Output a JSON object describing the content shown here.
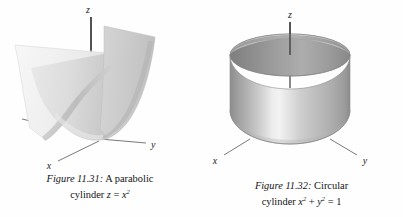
{
  "page": {
    "background": "#ffffff",
    "ink": "#1a1a1a"
  },
  "figures": [
    {
      "id": "figure-11-31",
      "label": "Figure 11.31:",
      "caption_line1": "A parabolic",
      "caption_line2_prefix": "cylinder ",
      "caption_line2_var1": "z",
      "caption_line2_eq": " = ",
      "caption_line2_var2": "x",
      "caption_line2_exp2": "2",
      "caption_plain": "Figure 11.31: A parabolic cylinder z = x²",
      "surface_name": "parabolic-cylinder",
      "axes": {
        "z": "z",
        "x": "x",
        "y": "y"
      },
      "colors": {
        "surface_light": "#f2f2f2",
        "surface_mid": "#d9d9d9",
        "surface_dark": "#b4b4b4",
        "axis_line": "#3a3a3a"
      }
    },
    {
      "id": "figure-11-32",
      "label": "Figure 11.32:",
      "caption_line1": "Circular",
      "caption_line2_prefix": "cylinder ",
      "caption_line2_var1": "x",
      "caption_line2_exp1": "2",
      "caption_line2_plus": " + ",
      "caption_line2_var2": "y",
      "caption_line2_exp2": "2",
      "caption_line2_eq": " = ",
      "caption_line2_value": "1",
      "caption_plain": "Figure 11.32: Circular cylinder x² + y² = 1",
      "surface_name": "circular-cylinder",
      "axes": {
        "z": "z",
        "x": "x",
        "y": "y"
      },
      "colors": {
        "surface_light": "#ededed",
        "surface_mid": "#c4c4c4",
        "surface_dark": "#909090",
        "inner_wall": "#9b9b9b",
        "axis_line": "#3a3a3a"
      }
    }
  ]
}
